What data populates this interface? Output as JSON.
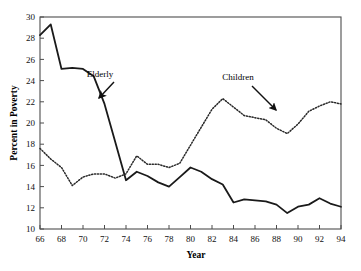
{
  "chart_data": {
    "type": "line",
    "title": "",
    "xlabel": "Year",
    "ylabel": "Percent in Poverty",
    "xlim": [
      66,
      94
    ],
    "ylim": [
      10,
      30
    ],
    "xticks": [
      66,
      68,
      70,
      72,
      74,
      76,
      78,
      80,
      82,
      84,
      86,
      88,
      90,
      92,
      94
    ],
    "yticks": [
      10,
      12,
      14,
      16,
      18,
      20,
      22,
      24,
      26,
      28,
      30
    ],
    "xtick_labels": [
      "66",
      "68",
      "70",
      "72",
      "74",
      "76",
      "78",
      "80",
      "82",
      "84",
      "86",
      "88",
      "90",
      "92",
      "94"
    ],
    "ytick_labels": [
      "10",
      "12",
      "14",
      "16",
      "18",
      "20",
      "22",
      "24",
      "26",
      "28",
      "30"
    ],
    "grid": false,
    "legend_position": "inline-annotations",
    "x": [
      66,
      67,
      68,
      69,
      70,
      71,
      72,
      73,
      74,
      75,
      76,
      77,
      78,
      79,
      80,
      81,
      82,
      83,
      84,
      85,
      86,
      87,
      88,
      89,
      90,
      91,
      92,
      93,
      94
    ],
    "series": [
      {
        "name": "Elderly",
        "style": "solid",
        "color": "#1a1a1a",
        "values": [
          28.3,
          29.3,
          25.1,
          25.2,
          25.1,
          24.4,
          21.8,
          18.2,
          14.6,
          15.4,
          15.0,
          14.4,
          14.0,
          14.9,
          15.8,
          15.4,
          14.7,
          14.2,
          12.5,
          12.8,
          12.7,
          12.6,
          12.3,
          11.5,
          12.1,
          12.3,
          12.9,
          12.4,
          12.1
        ]
      },
      {
        "name": "Children",
        "style": "dotted",
        "color": "#2a2a2a",
        "values": [
          17.6,
          16.6,
          15.8,
          14.1,
          14.9,
          15.2,
          15.2,
          14.8,
          15.2,
          16.9,
          16.1,
          16.1,
          15.8,
          16.2,
          17.9,
          19.6,
          21.3,
          22.3,
          21.5,
          20.7,
          20.5,
          20.3,
          19.5,
          19.0,
          19.9,
          21.1,
          21.6,
          22.0,
          21.8
        ]
      }
    ],
    "annotations": [
      {
        "text": "Elderly",
        "label_x": 100,
        "label_y": 77,
        "arrow_from_x": 114,
        "arrow_from_y": 82,
        "arrow_to_x": 99,
        "arrow_to_y": 98
      },
      {
        "text": "Children",
        "label_x": 238,
        "label_y": 80,
        "arrow_from_x": 252,
        "arrow_from_y": 86,
        "arrow_to_x": 276,
        "arrow_to_y": 110
      }
    ]
  },
  "caption": {
    "text": ""
  },
  "colors": {
    "frame": "#4d4d4d",
    "axis": "#4d4d4d",
    "elderly_line": "#1a1a1a",
    "children_line": "#2a2a2a",
    "background": "#ffffff"
  }
}
